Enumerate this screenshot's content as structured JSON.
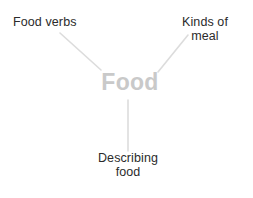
{
  "diagram": {
    "type": "mind-map",
    "title": "Food",
    "background_color": "#ffffff",
    "central_node": {
      "label": "Food",
      "color": "#c9c9c9",
      "font_size_px": 23,
      "bold": true,
      "x": 130,
      "y": 84
    },
    "branch_color": "#dcdcdc",
    "branch_label_color": "#2b2b2b",
    "branches": [
      {
        "id": "food-verbs",
        "label": "Food verbs",
        "position": "top-left",
        "line": {
          "x1": 60,
          "y1": 33,
          "x2": 101,
          "y2": 70
        }
      },
      {
        "id": "kinds-of-meal",
        "label": "Kinds of\nmeal",
        "position": "top-right",
        "line": {
          "x1": 188,
          "y1": 35,
          "x2": 158,
          "y2": 72
        }
      },
      {
        "id": "describing-food",
        "label": "Describing\nfood",
        "position": "bottom",
        "line": {
          "x1": 128,
          "y1": 100,
          "x2": 128,
          "y2": 151
        }
      }
    ]
  }
}
